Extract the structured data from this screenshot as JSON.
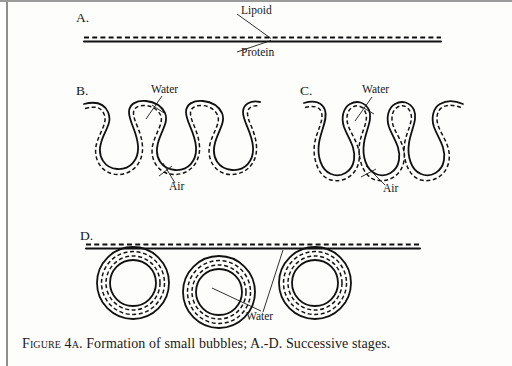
{
  "figure": {
    "caption_leadin": "Figure 4a.",
    "caption_rest": " Formation of small bubbles; A.-D. Successive stages.",
    "caption_full": "FIGURE 4A. Formation of small bubbles; A.-D. Successive stages."
  },
  "panels": {
    "a": {
      "letter": "A.",
      "labels": {
        "lipoid": "Lipoid",
        "protein": "Protein"
      }
    },
    "b": {
      "letter": "B.",
      "labels": {
        "water": "Water",
        "air": "Air"
      }
    },
    "c": {
      "letter": "C.",
      "labels": {
        "water": "Water",
        "air": "Air"
      }
    },
    "d": {
      "letter": "D.",
      "labels": {
        "water": "Water"
      }
    }
  },
  "colors": {
    "ink": "#111111",
    "paper": "#fdfdfc",
    "border": "#9a9a9a"
  }
}
